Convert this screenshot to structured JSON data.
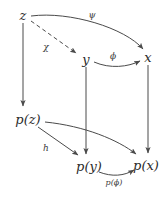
{
  "diagram": {
    "kind": "commutative-diagram",
    "background_color": "#ffffff",
    "stroke_color": "#4a4a4a",
    "text_color": "#2b2b2b",
    "nodes": [
      {
        "id": "z",
        "label": "z",
        "x": 23,
        "y": 15
      },
      {
        "id": "y",
        "label": "y",
        "x": 86,
        "y": 59
      },
      {
        "id": "x",
        "label": "x",
        "x": 148,
        "y": 57
      },
      {
        "id": "pz",
        "label": "p(z)",
        "x": 28,
        "y": 119
      },
      {
        "id": "py",
        "label": "p(y)",
        "x": 89,
        "y": 166
      },
      {
        "id": "px",
        "label": "p(x)",
        "x": 146,
        "y": 165
      }
    ],
    "edges": [
      {
        "id": "z-to-y",
        "label": "χ",
        "from": "z",
        "to": "y",
        "style": "dashed",
        "label_x": 46,
        "label_y": 47
      },
      {
        "id": "z-to-x",
        "label": "ψ",
        "from": "z",
        "to": "x",
        "style": "solid",
        "label_x": 92,
        "label_y": 15
      },
      {
        "id": "y-to-x",
        "label": "ϕ",
        "from": "y",
        "to": "x",
        "style": "solid",
        "label_x": 113,
        "label_y": 56
      },
      {
        "id": "z-to-pz",
        "label": "",
        "from": "z",
        "to": "pz",
        "style": "solid",
        "label_x": 0,
        "label_y": 0
      },
      {
        "id": "y-to-py",
        "label": "",
        "from": "y",
        "to": "py",
        "style": "solid",
        "label_x": 0,
        "label_y": 0
      },
      {
        "id": "x-to-px",
        "label": "",
        "from": "x",
        "to": "px",
        "style": "solid",
        "label_x": 0,
        "label_y": 0
      },
      {
        "id": "pz-to-py",
        "label": "h",
        "from": "pz",
        "to": "py",
        "style": "solid",
        "label_x": 46,
        "label_y": 148
      },
      {
        "id": "pz-to-px",
        "label": "",
        "from": "pz",
        "to": "px",
        "style": "solid",
        "label_x": 0,
        "label_y": 0
      },
      {
        "id": "py-to-px",
        "label": "p(ϕ)",
        "from": "py",
        "to": "px",
        "style": "solid",
        "label_x": 114,
        "label_y": 183
      }
    ]
  }
}
